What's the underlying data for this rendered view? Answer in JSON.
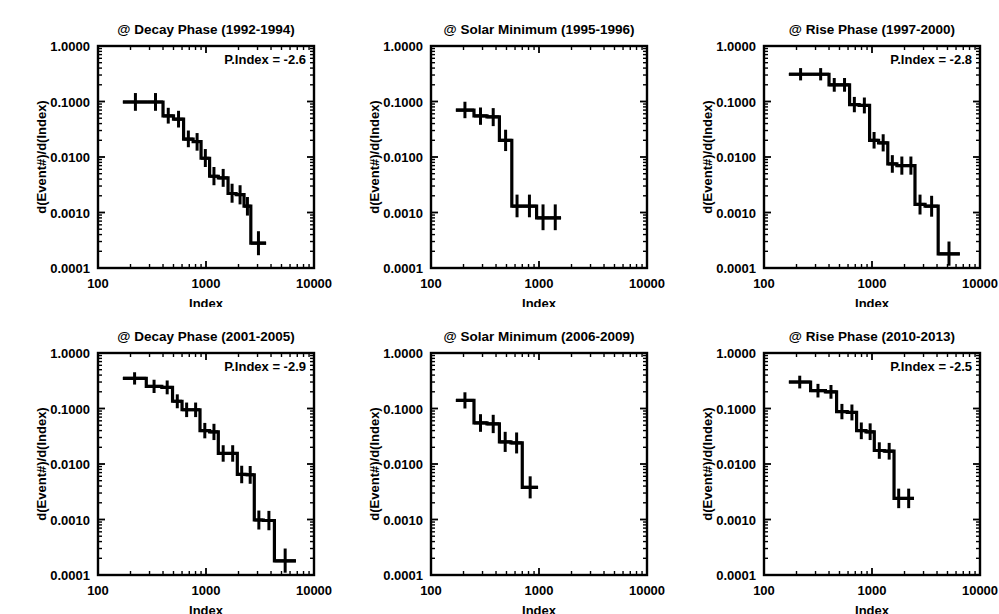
{
  "figure": {
    "n_panels": 6,
    "rows": 2,
    "cols": 3,
    "background": "#ffffff",
    "ink": "#000000"
  },
  "axes_common": {
    "xlabel": "Index",
    "ylabel": "d(Event#)/d(Index)",
    "xticklabels": [
      "100",
      "1000",
      "10000"
    ],
    "xtickvalues": [
      100,
      1000,
      10000
    ],
    "yticklabels": [
      "1.0000",
      "0.1000",
      "0.0100",
      "0.0010",
      "0.0001"
    ],
    "ytickvalues": [
      1.0,
      0.1,
      0.01,
      0.001,
      0.0001
    ],
    "xlim": [
      100,
      10000
    ],
    "ylim": [
      0.0001,
      1.0
    ],
    "xscale": "log",
    "yscale": "log",
    "grid": false,
    "pindex_prefix": "P.Index = "
  },
  "chart_data": [
    {
      "id": "panel-1",
      "type": "line",
      "title": "@ Decay Phase (1992-1994)",
      "annotation": "P.Index = -2.6",
      "pindex": -2.6,
      "xlabel": "Index",
      "ylabel": "d(Event#)/d(Index)",
      "xlim": [
        100,
        10000
      ],
      "ylim": [
        0.0001,
        1.0
      ],
      "bin_edges": [
        170,
        290,
        400,
        500,
        620,
        760,
        900,
        1080,
        1300,
        1600,
        1900,
        2250,
        2600,
        3600
      ],
      "values": [
        0.098,
        0.098,
        0.055,
        0.048,
        0.021,
        0.019,
        0.0095,
        0.0045,
        0.0042,
        0.0022,
        0.0021,
        0.0013,
        0.00028
      ],
      "err_lo": [
        0.068,
        0.068,
        0.04,
        0.034,
        0.015,
        0.013,
        0.0066,
        0.0031,
        0.0029,
        0.0015,
        0.0014,
        0.00088,
        0.00017
      ],
      "err_hi": [
        0.142,
        0.142,
        0.077,
        0.068,
        0.03,
        0.027,
        0.0139,
        0.0066,
        0.0061,
        0.0033,
        0.0031,
        0.0019,
        0.00046
      ]
    },
    {
      "id": "panel-2",
      "type": "line",
      "title": "@ Solar Minimum (1995-1996)",
      "annotation": "",
      "pindex": null,
      "xlabel": "Index",
      "ylabel": "d(Event#)/d(Index)",
      "xlim": [
        100,
        10000
      ],
      "ylim": [
        0.0001,
        1.0
      ],
      "bin_edges": [
        170,
        250,
        330,
        430,
        560,
        700,
        950,
        1250,
        1600
      ],
      "values": [
        0.07,
        0.055,
        0.053,
        0.02,
        0.0013,
        0.0013,
        0.0008,
        0.0008
      ],
      "err_lo": [
        0.05,
        0.038,
        0.036,
        0.0128,
        0.00082,
        0.00082,
        0.00048,
        0.00048
      ],
      "err_hi": [
        0.099,
        0.078,
        0.076,
        0.031,
        0.0021,
        0.0021,
        0.0014,
        0.0014
      ]
    },
    {
      "id": "panel-3",
      "type": "line",
      "title": "@ Rise Phase (1997-2000)",
      "annotation": "P.Index = -2.8",
      "pindex": -2.8,
      "xlabel": "Index",
      "ylabel": "d(Event#)/d(Index)",
      "xlim": [
        100,
        10000
      ],
      "ylim": [
        0.0001,
        1.0
      ],
      "bin_edges": [
        170,
        280,
        400,
        500,
        620,
        760,
        950,
        1150,
        1400,
        1700,
        2100,
        2500,
        3100,
        4100,
        6500
      ],
      "values": [
        0.31,
        0.31,
        0.2,
        0.2,
        0.088,
        0.085,
        0.02,
        0.018,
        0.0075,
        0.007,
        0.007,
        0.0014,
        0.0013,
        0.00018
      ],
      "err_lo": [
        0.24,
        0.24,
        0.15,
        0.15,
        0.064,
        0.061,
        0.0142,
        0.0126,
        0.0052,
        0.0048,
        0.0048,
        0.00092,
        0.00084,
        0.00011
      ],
      "err_hi": [
        0.4,
        0.4,
        0.265,
        0.265,
        0.121,
        0.118,
        0.0282,
        0.0257,
        0.0108,
        0.0102,
        0.0102,
        0.0021,
        0.002,
        0.0003
      ]
    },
    {
      "id": "panel-4",
      "type": "line",
      "title": "@ Decay Phase (2001-2005)",
      "annotation": "P.Index = -2.9",
      "pindex": -2.9,
      "xlabel": "Index",
      "ylabel": "d(Event#)/d(Index)",
      "xlim": [
        100,
        10000
      ],
      "ylim": [
        0.0001,
        1.0
      ],
      "bin_edges": [
        170,
        280,
        390,
        490,
        600,
        730,
        880,
        1080,
        1300,
        1600,
        1950,
        2350,
        2800,
        3400,
        4300,
        6800
      ],
      "values": [
        0.35,
        0.25,
        0.24,
        0.135,
        0.095,
        0.095,
        0.04,
        0.038,
        0.0155,
        0.0155,
        0.0065,
        0.0064,
        0.00098,
        0.00096,
        0.00018
      ],
      "err_lo": [
        0.27,
        0.19,
        0.18,
        0.101,
        0.07,
        0.07,
        0.029,
        0.027,
        0.011,
        0.011,
        0.0045,
        0.0044,
        0.00066,
        0.00064,
        0.00011
      ],
      "err_hi": [
        0.45,
        0.33,
        0.32,
        0.18,
        0.128,
        0.128,
        0.055,
        0.053,
        0.0218,
        0.0218,
        0.0093,
        0.0092,
        0.00145,
        0.00143,
        0.0003
      ]
    },
    {
      "id": "panel-5",
      "type": "line",
      "title": "@ Solar Minimum  (2006-2009)",
      "annotation": "",
      "pindex": null,
      "xlabel": "Index",
      "ylabel": "d(Event#)/d(Index)",
      "xlim": [
        100,
        10000
      ],
      "ylim": [
        0.0001,
        1.0
      ],
      "bin_edges": [
        170,
        250,
        330,
        430,
        550,
        700,
        980
      ],
      "values": [
        0.14,
        0.055,
        0.053,
        0.025,
        0.024,
        0.0038
      ],
      "err_lo": [
        0.1,
        0.038,
        0.036,
        0.0165,
        0.0155,
        0.0024,
        0.0
      ],
      "err_hi": [
        0.196,
        0.079,
        0.077,
        0.038,
        0.037,
        0.006,
        0.0
      ]
    },
    {
      "id": "panel-6",
      "type": "line",
      "title": "@ Rise Phase  (2010-2013)",
      "annotation": "P.Index = -2.5",
      "pindex": -2.5,
      "xlabel": "Index",
      "ylabel": "d(Event#)/d(Index)",
      "xlim": [
        100,
        10000
      ],
      "ylim": [
        0.0001,
        1.0
      ],
      "bin_edges": [
        170,
        270,
        370,
        470,
        590,
        720,
        880,
        1050,
        1300,
        1600,
        1950,
        2450
      ],
      "values": [
        0.3,
        0.21,
        0.2,
        0.088,
        0.085,
        0.04,
        0.038,
        0.0175,
        0.017,
        0.0024,
        0.0024
      ],
      "err_lo": [
        0.23,
        0.158,
        0.15,
        0.064,
        0.061,
        0.028,
        0.027,
        0.0124,
        0.012,
        0.0016,
        0.0016
      ],
      "err_hi": [
        0.39,
        0.278,
        0.265,
        0.121,
        0.118,
        0.056,
        0.054,
        0.0246,
        0.024,
        0.0036,
        0.0036
      ]
    }
  ]
}
